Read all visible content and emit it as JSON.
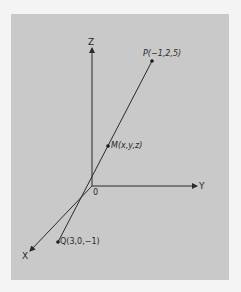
{
  "diagram": {
    "type": "3d-coordinate-axes",
    "axes": {
      "z_label": "Z",
      "y_label": "Y",
      "x_label": "X",
      "origin_label": "0"
    },
    "points": {
      "P": {
        "label": "P(−1,2,5)"
      },
      "M": {
        "label": "M(x,y,z)"
      },
      "Q": {
        "label": "Q(3,0,−1)"
      }
    },
    "colors": {
      "background": "#f4f4f4",
      "panel": "#c9c9c9",
      "ink": "#2a2a2a"
    }
  }
}
